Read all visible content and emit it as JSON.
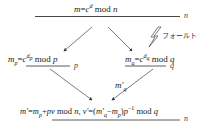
{
  "diagram": {
    "top": {
      "lhs": "m",
      "eq": "=",
      "base": "c",
      "exp": "d",
      "op": "mod",
      "mod": "n",
      "line_label": "n"
    },
    "left": {
      "lhs": "m",
      "lhs_sub": "p",
      "eq": "=",
      "base": "c",
      "exp": "d",
      "exp_sub": "p",
      "op": "mod",
      "mod": "p",
      "line_label": "p"
    },
    "right": {
      "lhs": "m",
      "lhs_sub": "q",
      "eq": "=",
      "base": "c",
      "exp": "d",
      "exp_sub": "q",
      "op": "mod",
      "mod": "q",
      "line_label": "q",
      "fault_label": "フォールト"
    },
    "edge_label": {
      "main": "m′",
      "sub": "q"
    },
    "bottom": {
      "part1_lhs": "m′",
      "part1_eq": "=",
      "part1_rhs": "m",
      "part1_rhs_sub": "p",
      "part1_plus": "+",
      "part1_term": "pv",
      "part1_op": "mod",
      "part1_mod": "n,",
      "part2_lhs": "v′",
      "part2_eq": "=",
      "part2_open": "(",
      "part2_a": "m′",
      "part2_a_sub": "q",
      "part2_minus": "−",
      "part2_b": "m",
      "part2_b_sub": "p",
      "part2_close": ")",
      "part2_p": "p",
      "part2_exp": "−1",
      "part2_op": "mod",
      "part2_mod": "q",
      "line_label": "n"
    },
    "colors": {
      "ink": "#222222",
      "line": "#333333",
      "background": "#ffffff"
    }
  }
}
